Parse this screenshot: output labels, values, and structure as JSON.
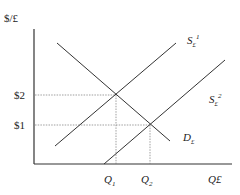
{
  "diagram": {
    "type": "supply-demand",
    "y_axis_label": "$/£",
    "x_axis_label": "Q£",
    "price_levels": [
      {
        "label": "$2",
        "y": 95
      },
      {
        "label": "$1",
        "y": 125
      }
    ],
    "quantity_levels": [
      {
        "label": "Q",
        "sub": "1",
        "x": 116
      },
      {
        "label": "Q",
        "sub": "2",
        "x": 150
      }
    ],
    "curves": [
      {
        "name": "S£1",
        "label": "S",
        "sub": "£",
        "sup": "1"
      },
      {
        "name": "S£2",
        "label": "S",
        "sub": "£",
        "sup": "2"
      },
      {
        "name": "D£",
        "label": "D",
        "sub": "£"
      }
    ],
    "colors": {
      "line": "#333333",
      "guide": "#777777"
    }
  }
}
